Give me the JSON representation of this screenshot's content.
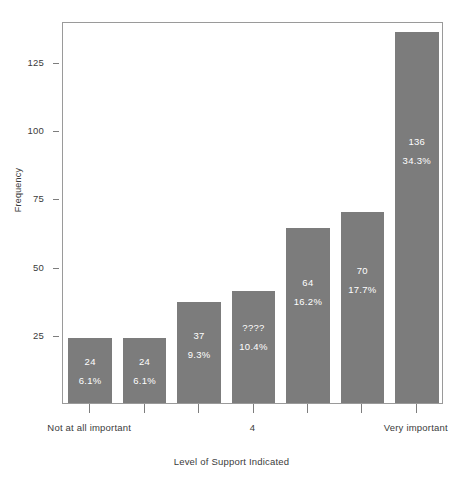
{
  "chart_data": {
    "type": "bar",
    "title": "",
    "subtitle": "",
    "xlabel": "Level of Support Indicated",
    "ylabel": "Frequency",
    "categories": [
      "1",
      "2",
      "3",
      "4",
      "5",
      "6",
      "7"
    ],
    "values": [
      24,
      24,
      37,
      41,
      64,
      70,
      136
    ],
    "count_labels": [
      "24",
      "24",
      "37",
      "????",
      "64",
      "70",
      "136"
    ],
    "percent_labels": [
      "6.1%",
      "6.1%",
      "9.3%",
      "10.4%",
      "16.2%",
      "17.7%",
      "34.3%"
    ],
    "percent_values": [
      6.1,
      6.1,
      9.3,
      10.4,
      16.2,
      17.7,
      34.3
    ],
    "ylim": [
      0,
      140
    ],
    "y_ticks": [
      25,
      50,
      75,
      100,
      125
    ],
    "y_tick_labels": [
      "25",
      "50",
      "75",
      "100",
      "125"
    ],
    "x_tick_labels": [
      "Not at all important",
      "",
      "",
      "4",
      "",
      "",
      "Very important"
    ],
    "grid": false,
    "legend": null,
    "bar_color": "#7c7c7c",
    "bar_label_color": "#ffffff",
    "axis_color": "#7d7d7d",
    "plot_border_color": "#9a9a9a",
    "background_color": "#ffffff",
    "text_color": "#3b3b3b"
  }
}
